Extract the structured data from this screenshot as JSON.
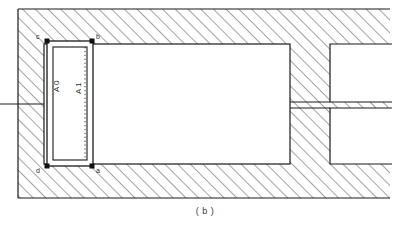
{
  "figure": {
    "caption": "( b )",
    "type": "engineering-cross-section"
  },
  "colors": {
    "outline": "#1a1a1a",
    "hatch": "#555555",
    "background": "#ffffff",
    "void_fill": "#ffffff",
    "text": "#2b2b2b",
    "caption": "#3a3a3a"
  },
  "labels": {
    "corner_top_left": "c",
    "corner_top_right": "b",
    "corner_bottom_left": "d",
    "corner_bottom_right": "a",
    "inner_left": "A 0",
    "inner_right": "A 1"
  },
  "geometry": {
    "hatch_region": {
      "x": 18,
      "y": 9,
      "width": 372,
      "height": 189
    },
    "void_left": {
      "x": 44,
      "y": 44,
      "width": 246,
      "height": 120
    },
    "void_right_top": {
      "x": 330,
      "y": 44,
      "width": 60,
      "height": 58
    },
    "void_right_bottom": {
      "x": 330,
      "y": 108,
      "width": 60,
      "height": 56
    },
    "detail_outer": {
      "x": 47,
      "y": 41,
      "width": 46,
      "height": 125
    },
    "detail_inner": {
      "x": 53,
      "y": 47,
      "width": 34,
      "height": 113
    },
    "center_dotted_x": 85,
    "left_notch_y": 104,
    "mid_bar_y": 104
  }
}
